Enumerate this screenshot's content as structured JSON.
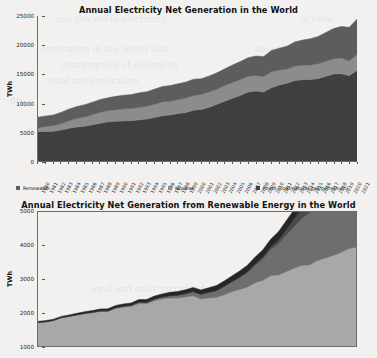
{
  "page": {
    "background_color": "#f2f1ef",
    "bleed_text": [
      {
        "t": "and the world electricity",
        "x": 55,
        "y": 14
      },
      {
        "t": "of total",
        "x": 300,
        "y": 14
      },
      {
        "t": "generation in the world was",
        "x": 40,
        "y": 44
      },
      {
        "t": "about 2.0%",
        "x": 255,
        "y": 44
      },
      {
        "t": "consumption of electricity",
        "x": 60,
        "y": 60
      },
      {
        "t": "in 2021 and the",
        "x": 250,
        "y": 60
      },
      {
        "t": "total net generation",
        "x": 48,
        "y": 76
      },
      {
        "t": "renewable sources",
        "x": 230,
        "y": 76
      },
      {
        "t": "8%",
        "x": 10,
        "y": 96
      },
      {
        "t": "electricity generation",
        "x": 120,
        "y": 150
      },
      {
        "t": "hydro",
        "x": 300,
        "y": 150
      },
      {
        "t": "wind and solar increased",
        "x": 90,
        "y": 284
      },
      {
        "t": "over the",
        "x": 300,
        "y": 284
      },
      {
        "t": "same period from",
        "x": 80,
        "y": 330
      }
    ]
  },
  "chart_data": [
    {
      "id": "chart1",
      "type": "area",
      "stacked": true,
      "title": "Annual Electricity Net Generation in the World",
      "xlabel": "",
      "ylabel": "TWh",
      "ylim": [
        0,
        25000
      ],
      "yticks": [
        0,
        5000,
        10000,
        15000,
        20000,
        25000
      ],
      "grid": false,
      "legend_position": "bottom",
      "x": [
        1980,
        1981,
        1982,
        1983,
        1984,
        1985,
        1986,
        1987,
        1988,
        1989,
        1990,
        1991,
        1992,
        1993,
        1994,
        1995,
        1996,
        1997,
        1998,
        1999,
        2000,
        2001,
        2002,
        2003,
        2004,
        2005,
        2006,
        2007,
        2008,
        2009,
        2010,
        2011,
        2012,
        2013,
        2014,
        2015,
        2016,
        2017,
        2018,
        2019,
        2020,
        2021
      ],
      "series": [
        {
          "name": "Fossil (coal/natural gas/petroleum)",
          "color": "#3f3f3f",
          "values": [
            5050,
            5100,
            5150,
            5350,
            5650,
            5850,
            6000,
            6250,
            6500,
            6750,
            6850,
            6900,
            6950,
            7100,
            7250,
            7500,
            7800,
            7950,
            8200,
            8350,
            8750,
            8900,
            9250,
            9800,
            10300,
            10800,
            11300,
            11900,
            12050,
            11900,
            12650,
            13100,
            13400,
            13900,
            14000,
            14050,
            14200,
            14600,
            15000,
            15050,
            14700,
            15600
          ]
        },
        {
          "name": "Nuclear",
          "color": "#8c8c8c",
          "values": [
            700,
            850,
            950,
            1100,
            1300,
            1500,
            1600,
            1750,
            1900,
            1950,
            2000,
            2100,
            2100,
            2150,
            2200,
            2300,
            2400,
            2350,
            2400,
            2500,
            2550,
            2600,
            2650,
            2600,
            2700,
            2750,
            2750,
            2700,
            2700,
            2650,
            2750,
            2600,
            2450,
            2470,
            2500,
            2520,
            2570,
            2600,
            2650,
            2700,
            2600,
            2750
          ]
        },
        {
          "name": "Renewable",
          "color": "#5d5d5d",
          "values": [
            1800,
            1800,
            1850,
            1950,
            2000,
            2050,
            2100,
            2150,
            2200,
            2200,
            2300,
            2350,
            2400,
            2500,
            2500,
            2600,
            2650,
            2700,
            2700,
            2750,
            2800,
            2700,
            2750,
            2800,
            2900,
            3000,
            3100,
            3200,
            3350,
            3450,
            3650,
            3750,
            3950,
            4150,
            4350,
            4500,
            4700,
            4950,
            5200,
            5450,
            5750,
            6100
          ]
        }
      ]
    },
    {
      "id": "chart2",
      "type": "area",
      "stacked": true,
      "title": "Annual Electricity Net Generation from Renewable Energy in the World",
      "xlabel": "",
      "ylabel": "TWh",
      "ylim": [
        1000,
        5000
      ],
      "yticks": [
        1000,
        2000,
        3000,
        4000,
        5000
      ],
      "grid": false,
      "legend_position": "none",
      "x": [
        1980,
        1981,
        1982,
        1983,
        1984,
        1985,
        1986,
        1987,
        1988,
        1989,
        1990,
        1991,
        1992,
        1993,
        1994,
        1995,
        1996,
        1997,
        1998,
        1999,
        2000,
        2001,
        2002,
        2003,
        2004,
        2005,
        2006,
        2007,
        2008,
        2009,
        2010,
        2011,
        2012,
        2013,
        2014,
        2015,
        2016,
        2017,
        2018,
        2019,
        2020,
        2021
      ],
      "series": [
        {
          "name": "Hydroelectric",
          "color": "#a8a8a8",
          "values": [
            1700,
            1720,
            1760,
            1840,
            1880,
            1920,
            1960,
            1990,
            2030,
            2030,
            2120,
            2160,
            2180,
            2270,
            2260,
            2350,
            2400,
            2430,
            2430,
            2460,
            2500,
            2400,
            2430,
            2450,
            2530,
            2620,
            2690,
            2760,
            2890,
            2960,
            3100,
            3120,
            3220,
            3320,
            3400,
            3420,
            3550,
            3620,
            3700,
            3780,
            3900,
            3950
          ]
        },
        {
          "name": "Wind",
          "color": "#6e6e6e",
          "values": [
            5,
            6,
            7,
            8,
            10,
            12,
            14,
            16,
            18,
            20,
            24,
            28,
            32,
            38,
            44,
            52,
            60,
            70,
            85,
            100,
            120,
            140,
            165,
            200,
            240,
            290,
            350,
            430,
            520,
            640,
            780,
            930,
            1090,
            1240,
            1400,
            1560,
            1750,
            1950,
            2180,
            2400,
            2650,
            2900
          ]
        },
        {
          "name": "Solar",
          "color": "#4a4a4a",
          "values": [
            0,
            0,
            0,
            0,
            0,
            0,
            1,
            1,
            1,
            1,
            1,
            1,
            1,
            2,
            2,
            2,
            3,
            3,
            4,
            4,
            5,
            6,
            7,
            9,
            12,
            16,
            22,
            30,
            40,
            55,
            75,
            110,
            160,
            220,
            290,
            370,
            460,
            570,
            700,
            850,
            1020,
            1200
          ]
        },
        {
          "name": "Other renewable",
          "color": "#262626",
          "values": [
            30,
            32,
            34,
            36,
            38,
            42,
            46,
            50,
            55,
            58,
            62,
            66,
            70,
            75,
            80,
            86,
            92,
            98,
            105,
            112,
            120,
            128,
            136,
            145,
            155,
            166,
            178,
            190,
            205,
            218,
            234,
            250,
            266,
            282,
            300,
            316,
            334,
            352,
            372,
            392,
            412,
            432
          ]
        }
      ]
    }
  ],
  "chart1": {
    "title": "Annual Electricity Net Generation in the World",
    "ylabel": "TWh",
    "yticks": [
      "25000",
      "20000",
      "15000",
      "10000",
      "5000",
      "0"
    ],
    "xticks": [
      "1980",
      "1981",
      "1982",
      "1983",
      "1984",
      "1985",
      "1986",
      "1987",
      "1988",
      "1989",
      "1990",
      "1991",
      "1992",
      "1993",
      "1994",
      "1995",
      "1996",
      "1997",
      "1998",
      "1999",
      "2000",
      "2001",
      "2002",
      "2003",
      "2004",
      "2005",
      "2006",
      "2007",
      "2008",
      "2009",
      "2010",
      "2011",
      "2012",
      "2013",
      "2014",
      "2015",
      "2016",
      "2017",
      "2018",
      "2019",
      "2020",
      "2021"
    ],
    "legend": [
      {
        "label": "Renewable",
        "color": "#5d5d5d"
      },
      {
        "label": "Nuclear",
        "color": "#8c8c8c"
      },
      {
        "label": "Fossil (coal/natural gas/petroleum)",
        "color": "#3f3f3f"
      }
    ]
  },
  "chart2": {
    "title": "Annual Electricity Net Generation from Renewable Energy in the World",
    "ylabel": "TWh",
    "yticks": [
      "5000",
      "4000",
      "3000",
      "2000",
      "1000"
    ]
  }
}
